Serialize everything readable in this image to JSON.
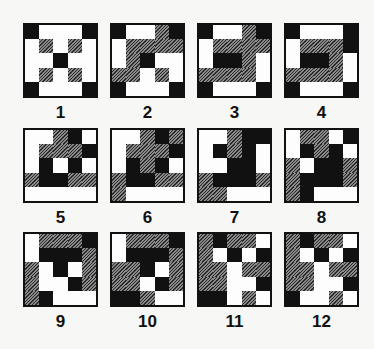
{
  "figure": {
    "legend": {
      "B": "black",
      "W": "white",
      "H": "hatched"
    },
    "colors": {
      "black": "#111111",
      "white": "#fdfdfd",
      "hatched": "#555555",
      "background": "#f7f7f5"
    },
    "patterns": [
      {
        "label": "1",
        "grid": [
          "BWWWB",
          "WHWHW",
          "WWBWW",
          "WHWHW",
          "BWWWB"
        ]
      },
      {
        "label": "2",
        "grid": [
          "BWWHB",
          "WHHHH",
          "WHBWW",
          "HHWHW",
          "BWWWB"
        ]
      },
      {
        "label": "3",
        "grid": [
          "BWWHB",
          "WHHHH",
          "WBBHW",
          "HHHHW",
          "BWWWB"
        ]
      },
      {
        "label": "4",
        "grid": [
          "BWWWB",
          "WHHHB",
          "WBBHW",
          "HHHHW",
          "BWWWB"
        ]
      },
      {
        "label": "5",
        "grid": [
          "WWHBW",
          "WHHHB",
          "WBWBW",
          "HBBHH",
          "WWWWW"
        ]
      },
      {
        "label": "6",
        "grid": [
          "WWHBH",
          "WHHHB",
          "WBHBW",
          "HBBHH",
          "HWWWW"
        ]
      },
      {
        "label": "7",
        "grid": [
          "WWHBB",
          "WBHBW",
          "WWBBW",
          "HBBBH",
          "HHWWW"
        ]
      },
      {
        "label": "8",
        "grid": [
          "WHHWB",
          "WBHBW",
          "HWBBH",
          "HBBBH",
          "HBWWW"
        ]
      },
      {
        "label": "9",
        "grid": [
          "WHHHB",
          "WBBBH",
          "HWBWH",
          "HWWBH",
          "HBWWW"
        ]
      },
      {
        "label": "10",
        "grid": [
          "WHHHB",
          "WBBBH",
          "HHBWH",
          "HHWBH",
          "BBHWW"
        ]
      },
      {
        "label": "11",
        "grid": [
          "HBHHW",
          "HWBWB",
          "HHWHH",
          "HHWWB",
          "BBWHW"
        ]
      },
      {
        "label": "12",
        "grid": [
          "HBHHW",
          "HWBWB",
          "HHWHH",
          "HHWWB",
          "BWWHW"
        ]
      }
    ]
  }
}
